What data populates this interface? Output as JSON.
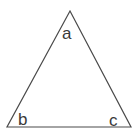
{
  "figure": {
    "name": "triangle-diagram",
    "type": "geometric-shape",
    "shape": "triangle",
    "background_color": "#ffffff",
    "stroke_color": "#4a4a4a",
    "stroke_width": 1.2,
    "fill_color": "none",
    "label_color": "#3a3a3a",
    "canvas": {
      "width": 139,
      "height": 137
    },
    "vertices": [
      {
        "id": "apex",
        "label": "a",
        "x": 70,
        "y": 11
      },
      {
        "id": "bottom-left",
        "label": "b",
        "x": 7,
        "y": 127
      },
      {
        "id": "bottom-right",
        "label": "c",
        "x": 131,
        "y": 127
      }
    ],
    "labels": {
      "a": "a",
      "b": "b",
      "c": "c"
    },
    "path": "M 70 11 L 131 127 L 7 127 Z"
  }
}
